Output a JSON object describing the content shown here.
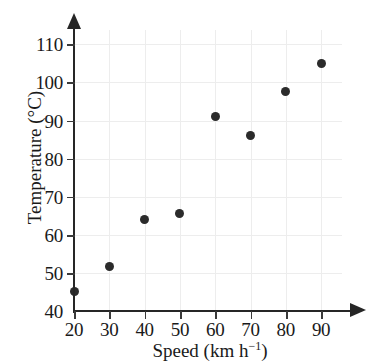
{
  "chart_data": {
    "type": "scatter",
    "title": "",
    "xlabel": "Speed (km h⁻¹)",
    "ylabel": "Temperature (°C)",
    "xlim": [
      20,
      90
    ],
    "ylim": [
      40,
      110
    ],
    "grid": true,
    "legend": false,
    "x": [
      20,
      30,
      40,
      50,
      60,
      70,
      80,
      90
    ],
    "values": [
      45,
      51.8,
      64,
      65.5,
      91,
      86,
      97.5,
      105
    ],
    "points": [
      {
        "x": 20,
        "y": 45
      },
      {
        "x": 30,
        "y": 51.8
      },
      {
        "x": 40,
        "y": 64
      },
      {
        "x": 50,
        "y": 65.5
      },
      {
        "x": 60,
        "y": 91
      },
      {
        "x": 70,
        "y": 86
      },
      {
        "x": 80,
        "y": 97.5
      },
      {
        "x": 90,
        "y": 105
      }
    ],
    "xticks": [
      20,
      30,
      40,
      50,
      60,
      70,
      80,
      90
    ],
    "yticks": [
      40,
      50,
      60,
      70,
      80,
      90,
      100,
      110
    ],
    "xtick_labels": [
      "20",
      "30",
      "40",
      "50",
      "60",
      "70",
      "80",
      "90"
    ],
    "ytick_labels": [
      "40",
      "50",
      "60",
      "70",
      "80",
      "90",
      "100",
      "110"
    ],
    "marker_color": "#2b2b2b",
    "axis_color": "#262626",
    "grid_color": "#ededed",
    "background_color": "#ffffff"
  },
  "axis_titles": {
    "x_prefix": "Speed (km h",
    "x_superscript": "−1",
    "x_suffix": ")",
    "y": "Temperature (°C)"
  }
}
